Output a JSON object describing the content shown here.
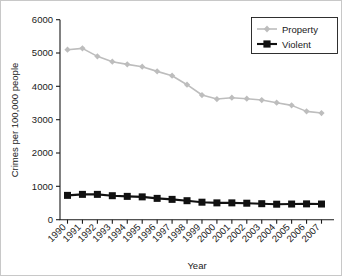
{
  "chart_data": {
    "type": "line",
    "title": "",
    "xlabel": "Year",
    "ylabel": "Crimes per 100,000 people",
    "categories": [
      "1990",
      "1991",
      "1992",
      "1993",
      "1994",
      "1995",
      "1996",
      "1997",
      "1998",
      "1999",
      "2000",
      "2001",
      "2002",
      "2003",
      "2004",
      "2005",
      "2006",
      "2007"
    ],
    "yticks": [
      0,
      1000,
      2000,
      3000,
      4000,
      5000,
      6000
    ],
    "ylim": [
      0,
      6000
    ],
    "grid": false,
    "legend_position": "top-right",
    "series": [
      {
        "name": "Property",
        "color": "#bdbdbd",
        "marker": "diamond",
        "values": [
          5100,
          5140,
          4900,
          4740,
          4660,
          4590,
          4450,
          4320,
          4050,
          3740,
          3620,
          3660,
          3630,
          3590,
          3510,
          3430,
          3250,
          3200
        ]
      },
      {
        "name": "Violent",
        "color": "#111111",
        "marker": "square",
        "values": [
          730,
          760,
          760,
          720,
          700,
          685,
          640,
          610,
          570,
          525,
          505,
          505,
          495,
          480,
          465,
          470,
          475,
          470
        ]
      }
    ]
  },
  "axes": {
    "y_title": "Crimes per 100,000 people",
    "x_title": "Year",
    "y_tick_labels": [
      "6000",
      "5000",
      "4000",
      "3000",
      "2000",
      "1000",
      "0"
    ],
    "x_tick_labels": [
      "1990",
      "1991",
      "1992",
      "1993",
      "1994",
      "1995",
      "1996",
      "1997",
      "1998",
      "1999",
      "2000",
      "2001",
      "2002",
      "2003",
      "2004",
      "2005",
      "2006",
      "2007"
    ]
  },
  "legend": {
    "entries": [
      {
        "label": "Property"
      },
      {
        "label": "Violent"
      }
    ]
  }
}
